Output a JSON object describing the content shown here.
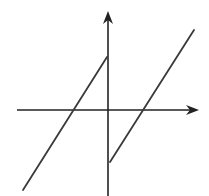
{
  "diagram": {
    "type": "function-graph",
    "colors": {
      "background": "#ffffff",
      "axis": "#222222",
      "curve": "#3a3a3a"
    },
    "axes": {
      "x_axis": {
        "from": [
          17,
          110
        ],
        "to": [
          199,
          110
        ],
        "arrow": "right"
      },
      "y_axis": {
        "from": [
          108,
          196
        ],
        "to": [
          108,
          11
        ],
        "arrow": "up"
      }
    },
    "segments": [
      {
        "name": "left-branch",
        "from": [
          23,
          190
        ],
        "to": [
          107,
          57
        ],
        "x_intercept": [
          72,
          110
        ]
      },
      {
        "name": "right-branch",
        "from": [
          110,
          162
        ],
        "to": [
          194,
          30
        ],
        "x_intercept": [
          142,
          110
        ]
      }
    ]
  }
}
